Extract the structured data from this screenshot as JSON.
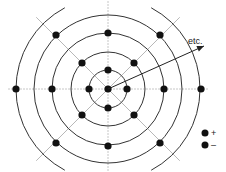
{
  "diagram": {
    "center": [
      108,
      89
    ],
    "circles": [
      {
        "r": 19,
        "full": true
      },
      {
        "r": 37,
        "full": true
      },
      {
        "r": 56,
        "full": true
      },
      {
        "r": 74,
        "full": false
      },
      {
        "r": 92,
        "full": false
      }
    ],
    "dots": [
      {
        "x": 108,
        "y": 89
      },
      {
        "x": 108,
        "y": 70
      },
      {
        "x": 89,
        "y": 89
      },
      {
        "x": 127,
        "y": 89
      },
      {
        "x": 108,
        "y": 108
      },
      {
        "x": 82,
        "y": 63
      },
      {
        "x": 134,
        "y": 63
      },
      {
        "x": 82,
        "y": 115
      },
      {
        "x": 134,
        "y": 115
      },
      {
        "x": 108,
        "y": 33
      },
      {
        "x": 52,
        "y": 89
      },
      {
        "x": 164,
        "y": 89
      },
      {
        "x": 108,
        "y": 146
      },
      {
        "x": 56,
        "y": 35
      },
      {
        "x": 160,
        "y": 35
      },
      {
        "x": 56,
        "y": 143
      },
      {
        "x": 160,
        "y": 143
      },
      {
        "x": 16,
        "y": 89
      },
      {
        "x": 201,
        "y": 89
      }
    ],
    "arrow": {
      "from": [
        108,
        89
      ],
      "to": [
        204,
        46
      ],
      "label": "etc."
    },
    "legend": [
      {
        "symbol": "dot",
        "label": "+"
      },
      {
        "symbol": "dot",
        "label": "–"
      }
    ],
    "colors": {
      "line": "#333333",
      "grid": "#b8b8b8",
      "dot": "#111111"
    }
  }
}
